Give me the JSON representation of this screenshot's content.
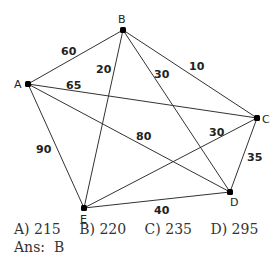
{
  "graph": {
    "nodes": [
      {
        "id": "A",
        "x": 28,
        "y": 84,
        "lx": 14,
        "ly": 88
      },
      {
        "id": "B",
        "x": 123,
        "y": 30,
        "lx": 118,
        "ly": 23
      },
      {
        "id": "C",
        "x": 257,
        "y": 118,
        "lx": 262,
        "ly": 123
      },
      {
        "id": "D",
        "x": 230,
        "y": 192,
        "lx": 230,
        "ly": 206
      },
      {
        "id": "E",
        "x": 84,
        "y": 208,
        "lx": 80,
        "ly": 223
      }
    ],
    "edges": [
      {
        "from": "A",
        "to": "B",
        "weight": "60",
        "wx": 61,
        "wy": 55
      },
      {
        "from": "A",
        "to": "C",
        "weight": "65",
        "wx": 66,
        "wy": 89
      },
      {
        "from": "A",
        "to": "D",
        "weight": "80",
        "wx": 136,
        "wy": 140
      },
      {
        "from": "A",
        "to": "E",
        "weight": "90",
        "wx": 36,
        "wy": 153
      },
      {
        "from": "B",
        "to": "E",
        "weight": "20",
        "wx": 96,
        "wy": 73
      },
      {
        "from": "B",
        "to": "D",
        "weight": "30",
        "wx": 154,
        "wy": 78
      },
      {
        "from": "B",
        "to": "C",
        "weight": "10",
        "wx": 189,
        "wy": 70
      },
      {
        "from": "C",
        "to": "E",
        "weight": "30",
        "wx": 209,
        "wy": 136
      },
      {
        "from": "C",
        "to": "D",
        "weight": "35",
        "wx": 247,
        "wy": 161
      },
      {
        "from": "E",
        "to": "D",
        "weight": "40",
        "wx": 154,
        "wy": 214
      }
    ]
  },
  "question": {
    "options": [
      {
        "label": "A)",
        "value": "215"
      },
      {
        "label": "B)",
        "value": "220"
      },
      {
        "label": "C)",
        "value": "235"
      },
      {
        "label": "D)",
        "value": "295"
      }
    ],
    "answer_label": "Ans:",
    "answer_value": "B"
  }
}
